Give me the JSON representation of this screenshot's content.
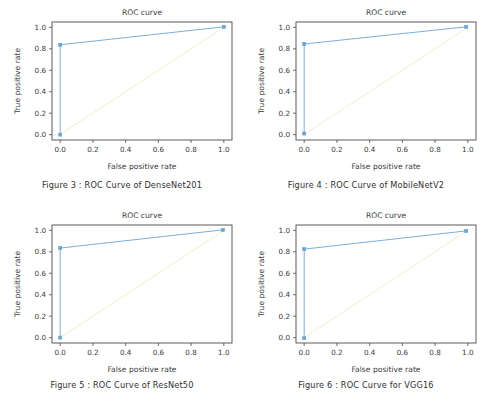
{
  "page": {
    "background_color": "#ffffff",
    "layout": "2x2 grid of ROC curve figures"
  },
  "style": {
    "roc_color": "#6aa6d6",
    "diagonal_color": "#f2eecb",
    "axis_color": "#4a4a4a",
    "text_color": "#3a3a3a"
  },
  "common": {
    "title": "ROC curve",
    "xlabel": "False positive rate",
    "ylabel": "True positive rate",
    "xticks": [
      "0.0",
      "0.2",
      "0.4",
      "0.6",
      "0.8",
      "1.0"
    ],
    "yticks": [
      "0.0",
      "0.2",
      "0.4",
      "0.6",
      "0.8",
      "1.0"
    ],
    "xtick_values": [
      0.0,
      0.2,
      0.4,
      0.6,
      0.8,
      1.0
    ],
    "ytick_values": [
      0.0,
      0.2,
      0.4,
      0.6,
      0.8,
      1.0
    ]
  },
  "figures": [
    {
      "id": "fig3",
      "caption": "Figure 3 : ROC Curve of DenseNet201",
      "model": "DenseNet201"
    },
    {
      "id": "fig4",
      "caption": "Figure 4 : ROC Curve of MobileNetV2",
      "model": "MobileNetV2"
    },
    {
      "id": "fig5",
      "caption": "Figure 5 : ROC Curve of ResNet50",
      "model": "ResNet50"
    },
    {
      "id": "fig6",
      "caption": "Figure 6 : ROC Curve for VGG16",
      "model": "VGG16"
    }
  ],
  "chart_data": [
    {
      "type": "line",
      "id": "fig3",
      "title": "ROC curve",
      "xlabel": "False positive rate",
      "ylabel": "True positive rate",
      "xlim": [
        -0.05,
        1.05
      ],
      "ylim": [
        -0.05,
        1.05
      ],
      "grid": false,
      "legend": "none",
      "series": [
        {
          "name": "ROC (DenseNet201)",
          "color": "#6aa6d6",
          "markers": true,
          "x": [
            0.0,
            0.0,
            1.0
          ],
          "y": [
            0.0,
            0.838,
            1.005
          ]
        },
        {
          "name": "chance diagonal",
          "color": "#f2eecb",
          "markers": false,
          "x": [
            0.0,
            1.0
          ],
          "y": [
            0.0,
            1.0
          ]
        }
      ]
    },
    {
      "type": "line",
      "id": "fig4",
      "title": "ROC curve",
      "xlabel": "False positive rate",
      "ylabel": "True positive rate",
      "xlim": [
        -0.05,
        1.05
      ],
      "ylim": [
        -0.05,
        1.05
      ],
      "grid": false,
      "legend": "none",
      "series": [
        {
          "name": "ROC (MobileNetV2)",
          "color": "#6aa6d6",
          "markers": true,
          "x": [
            0.0,
            0.0,
            0.99
          ],
          "y": [
            0.01,
            0.845,
            1.005
          ]
        },
        {
          "name": "chance diagonal",
          "color": "#f2eecb",
          "markers": false,
          "x": [
            0.0,
            1.0
          ],
          "y": [
            0.0,
            1.0
          ]
        }
      ]
    },
    {
      "type": "line",
      "id": "fig5",
      "title": "ROC curve",
      "xlabel": "False positive rate",
      "ylabel": "True positive rate",
      "xlim": [
        -0.05,
        1.05
      ],
      "ylim": [
        -0.05,
        1.05
      ],
      "grid": false,
      "legend": "none",
      "series": [
        {
          "name": "ROC (ResNet50)",
          "color": "#6aa6d6",
          "markers": true,
          "x": [
            0.0,
            0.0,
            0.995
          ],
          "y": [
            0.0,
            0.835,
            1.005
          ]
        },
        {
          "name": "chance diagonal",
          "color": "#f2eecb",
          "markers": false,
          "x": [
            0.0,
            1.0
          ],
          "y": [
            0.0,
            1.0
          ]
        }
      ]
    },
    {
      "type": "line",
      "id": "fig6",
      "title": "ROC curve",
      "xlabel": "False positive rate",
      "ylabel": "True positive rate",
      "xlim": [
        -0.05,
        1.05
      ],
      "ylim": [
        -0.05,
        1.05
      ],
      "grid": false,
      "legend": "none",
      "series": [
        {
          "name": "ROC (VGG16)",
          "color": "#6aa6d6",
          "markers": true,
          "x": [
            0.0,
            0.0,
            0.99
          ],
          "y": [
            -0.005,
            0.825,
            0.995
          ]
        },
        {
          "name": "chance diagonal",
          "color": "#f2eecb",
          "markers": false,
          "x": [
            0.0,
            1.0
          ],
          "y": [
            0.0,
            1.0
          ]
        }
      ]
    }
  ]
}
